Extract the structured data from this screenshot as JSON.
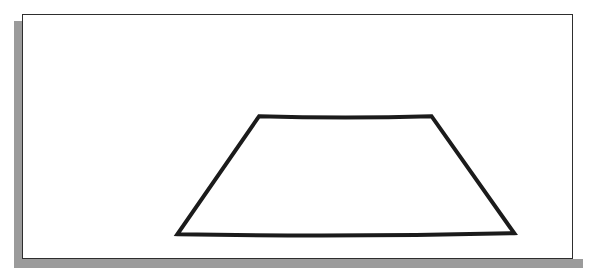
{
  "canvas": {
    "width": 606,
    "height": 275,
    "background_color": "#ffffff"
  },
  "panel": {
    "name": "figure-panel",
    "x": 22,
    "y": 14,
    "width": 551,
    "height": 245,
    "background_color": "#ffffff",
    "border_color": "#2e2e2e",
    "border_width": 1
  },
  "shadow": {
    "color": "#9b9b9b",
    "offset_x": -8,
    "offset_y": 9,
    "thickness": 9,
    "left_band": {
      "x": 14,
      "y": 21,
      "width": 9,
      "height": 247
    },
    "bottom_band": {
      "x": 14,
      "y": 259,
      "width": 569,
      "height": 9
    }
  },
  "figure": {
    "name": "trapezoid",
    "shape_type": "trapezoid",
    "stroke_color": "#1b1b1b",
    "stroke_width": 4,
    "fill": "none",
    "hand_drawn": true,
    "vertices": [
      {
        "label": "top-left",
        "x": 215,
        "y": 88
      },
      {
        "label": "top-right",
        "x": 388,
        "y": 88
      },
      {
        "label": "bottom-right",
        "x": 471,
        "y": 206
      },
      {
        "label": "bottom-left",
        "x": 133,
        "y": 207
      }
    ],
    "edges": [
      {
        "label": "top",
        "from": "top-left",
        "to": "top-right",
        "bow": "slight-downward"
      },
      {
        "label": "right",
        "from": "top-right",
        "to": "bottom-right",
        "bow": "none"
      },
      {
        "label": "bottom",
        "from": "bottom-right",
        "to": "bottom-left",
        "bow": "slight-downward"
      },
      {
        "label": "left",
        "from": "bottom-left",
        "to": "top-left",
        "bow": "none"
      }
    ],
    "path_d": "M 215 88 Q 301.5 90.5 388 88 L 471 206 Q 302 210 133 207 Z"
  }
}
